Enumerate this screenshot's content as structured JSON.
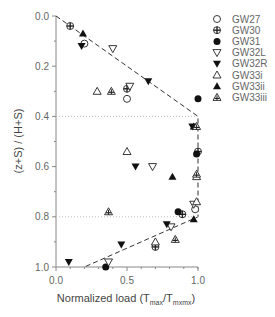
{
  "chart_data": {
    "type": "scatter",
    "title": "",
    "xlabel": "Normalized load (T_max/T_mxmx)",
    "xlabel_main": "Normalized load (T",
    "xlabel_sub1": "max",
    "xlabel_mid": "/T",
    "xlabel_sub2": "mxmx",
    "xlabel_end": ")",
    "ylabel": "(z+S) / (H+S)",
    "xlim": [
      0.0,
      1.0
    ],
    "ylim": [
      1.0,
      0.0
    ],
    "y_inverted": true,
    "x_ticks": [
      "0.0",
      "0.5",
      "1.0"
    ],
    "y_ticks": [
      "0.0",
      "0.2",
      "0.4",
      "0.6",
      "0.8",
      "1.0"
    ],
    "grid": false,
    "legend_position": "right",
    "reference_lines": [
      {
        "style": "dashed",
        "points": [
          [
            0.0,
            0.0
          ],
          [
            1.0,
            0.4
          ],
          [
            1.0,
            0.8
          ],
          [
            0.2,
            1.0
          ]
        ]
      },
      {
        "style": "dotted",
        "points": [
          [
            0.0,
            0.4
          ],
          [
            1.0,
            0.4
          ]
        ]
      },
      {
        "style": "dotted",
        "points": [
          [
            0.0,
            0.8
          ],
          [
            1.0,
            0.8
          ]
        ]
      }
    ],
    "series": [
      {
        "name": "GW27",
        "marker": "open-circle",
        "points": [
          [
            0.2,
            0.11
          ],
          [
            0.5,
            0.33
          ],
          [
            0.98,
            0.77
          ]
        ]
      },
      {
        "name": "GW30",
        "marker": "crossed-circle",
        "points": [
          [
            0.1,
            0.04
          ],
          [
            0.5,
            0.29
          ],
          [
            1.0,
            0.54
          ],
          [
            0.89,
            0.79
          ],
          [
            0.7,
            0.92
          ]
        ]
      },
      {
        "name": "GW31",
        "marker": "filled-circle",
        "points": [
          [
            1.0,
            0.33
          ],
          [
            0.99,
            0.55
          ],
          [
            0.86,
            0.78
          ],
          [
            0.35,
            1.0
          ]
        ]
      },
      {
        "name": "GW32L",
        "marker": "open-triangle-down",
        "points": [
          [
            0.4,
            0.13
          ],
          [
            0.52,
            0.28
          ],
          [
            0.68,
            0.6
          ],
          [
            0.97,
            0.75
          ],
          [
            0.81,
            0.84
          ],
          [
            0.37,
            0.98
          ]
        ]
      },
      {
        "name": "GW32R",
        "marker": "filled-triangle-down",
        "points": [
          [
            0.18,
            0.12
          ],
          [
            0.65,
            0.26
          ],
          [
            0.96,
            0.44
          ],
          [
            0.56,
            0.6
          ],
          [
            0.78,
            0.83
          ],
          [
            0.46,
            0.91
          ],
          [
            0.09,
            0.98
          ]
        ]
      },
      {
        "name": "GW33i",
        "marker": "open-triangle-up",
        "points": [
          [
            0.29,
            0.3
          ],
          [
            0.5,
            0.54
          ],
          [
            0.99,
            0.64
          ],
          [
            0.99,
            0.74
          ],
          [
            0.7,
            0.9
          ]
        ]
      },
      {
        "name": "GW33ii",
        "marker": "filled-triangle-up",
        "points": [
          [
            0.19,
            0.07
          ],
          [
            0.97,
            0.44
          ],
          [
            0.82,
            0.64
          ],
          [
            0.97,
            0.81
          ]
        ]
      },
      {
        "name": "GW33iii",
        "marker": "hatched-triangle-up",
        "points": [
          [
            0.39,
            0.3
          ],
          [
            0.37,
            0.78
          ],
          [
            0.99,
            0.44
          ],
          [
            0.84,
            0.89
          ],
          [
            0.99,
            0.63
          ]
        ]
      }
    ]
  }
}
